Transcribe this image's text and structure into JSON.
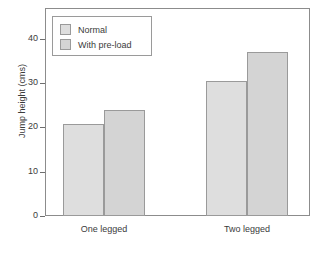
{
  "chart_data": {
    "type": "bar",
    "title": "",
    "xlabel": "",
    "ylabel": "Jump height (cms)",
    "categories": [
      "One legged",
      "Two legged"
    ],
    "series": [
      {
        "name": "Normal",
        "values": [
          20.7,
          30.5
        ],
        "color": "#dedede"
      },
      {
        "name": "With pre-load",
        "values": [
          23.9,
          37.0
        ],
        "color": "#d4d4d4"
      }
    ],
    "ylim": [
      0,
      47
    ],
    "yticks": [
      0,
      10,
      20,
      30,
      40
    ],
    "ytick_labels": [
      "0",
      "10",
      "20",
      "30",
      "40"
    ],
    "grid": false,
    "legend_position": "top-left",
    "bar_border_color": "#9a9a9a",
    "axis_color": "#8c8c8c"
  },
  "legend": {
    "entries": [
      {
        "label": "Normal"
      },
      {
        "label": "With pre-load"
      }
    ]
  }
}
